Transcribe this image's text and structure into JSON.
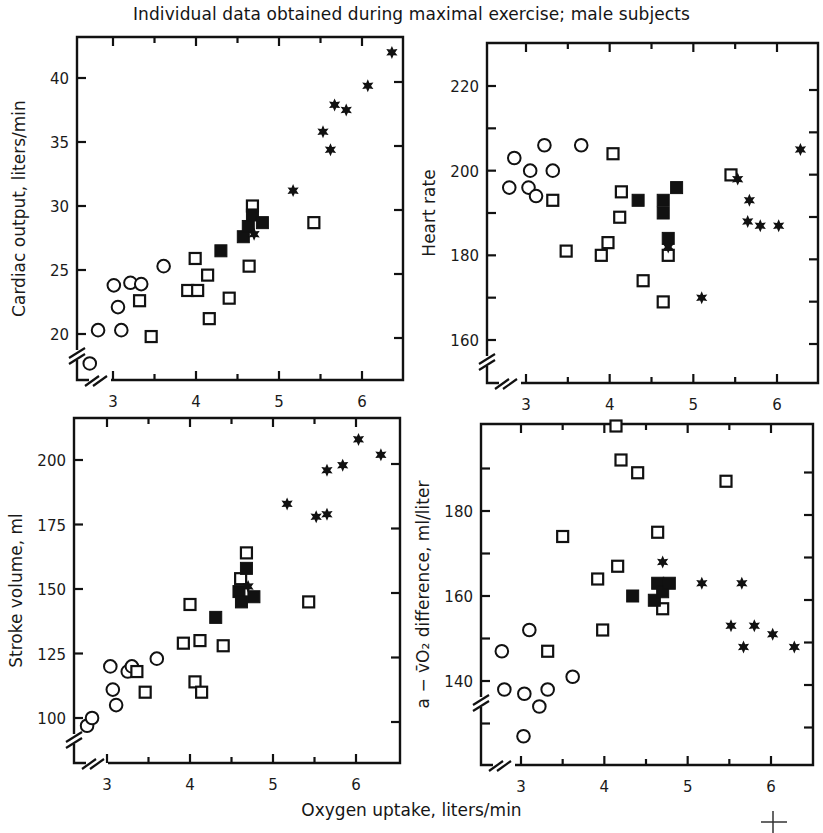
{
  "figure": {
    "title": "Individual data obtained during maximal exercise; male subjects",
    "shared_xlabel": "Oxygen uptake, liters/min"
  },
  "chart_data": [
    {
      "type": "scatter",
      "panel": "top-left",
      "title": "",
      "xlabel": "Oxygen uptake, liters/min",
      "ylabel": "Cardiac output, liters/min",
      "xlim": [
        2.6,
        6.5
      ],
      "ylim": [
        17,
        43
      ],
      "xticks": [
        3,
        4,
        5,
        6
      ],
      "yticks": [
        20,
        25,
        30,
        35,
        40
      ],
      "grid": false,
      "axis_break": true,
      "series": [
        {
          "name": "open circles",
          "marker": "open-circle",
          "points": [
            [
              2.72,
              17.7
            ],
            [
              2.82,
              20.3
            ],
            [
              3.01,
              23.8
            ],
            [
              3.06,
              22.1
            ],
            [
              3.1,
              20.3
            ],
            [
              3.21,
              24.0
            ],
            [
              3.34,
              23.9
            ],
            [
              3.61,
              25.3
            ]
          ]
        },
        {
          "name": "open squares",
          "marker": "open-square",
          "points": [
            [
              3.32,
              22.6
            ],
            [
              3.46,
              19.8
            ],
            [
              3.9,
              23.4
            ],
            [
              3.99,
              25.9
            ],
            [
              4.02,
              23.4
            ],
            [
              4.14,
              24.6
            ],
            [
              4.16,
              21.2
            ],
            [
              4.4,
              22.8
            ],
            [
              4.64,
              25.3
            ],
            [
              4.68,
              30.0
            ],
            [
              5.42,
              28.7
            ]
          ]
        },
        {
          "name": "filled squares",
          "marker": "filled-square",
          "points": [
            [
              4.3,
              26.5
            ],
            [
              4.57,
              27.6
            ],
            [
              4.63,
              28.4
            ],
            [
              4.68,
              29.3
            ],
            [
              4.8,
              28.7
            ]
          ]
        },
        {
          "name": "stars",
          "marker": "star",
          "points": [
            [
              4.7,
              27.8
            ],
            [
              5.17,
              31.2
            ],
            [
              5.53,
              35.8
            ],
            [
              5.62,
              34.4
            ],
            [
              5.67,
              37.9
            ],
            [
              5.81,
              37.5
            ],
            [
              6.07,
              39.4
            ],
            [
              6.36,
              42.0
            ]
          ]
        }
      ]
    },
    {
      "type": "scatter",
      "panel": "top-right",
      "title": "",
      "xlabel": "Oxygen uptake, liters/min",
      "ylabel": "Heart rate",
      "xlim": [
        2.6,
        6.5
      ],
      "ylim": [
        150,
        230
      ],
      "xticks": [
        3,
        4,
        5,
        6
      ],
      "yticks": [
        160,
        180,
        200,
        220
      ],
      "grid": false,
      "axis_break": true,
      "series": [
        {
          "name": "open circles",
          "marker": "open-circle",
          "points": [
            [
              2.8,
              196
            ],
            [
              2.86,
              203
            ],
            [
              3.03,
              196
            ],
            [
              3.05,
              200
            ],
            [
              3.12,
              194
            ],
            [
              3.22,
              206
            ],
            [
              3.32,
              200
            ],
            [
              3.66,
              206
            ]
          ]
        },
        {
          "name": "open squares",
          "marker": "open-square",
          "points": [
            [
              3.32,
              193
            ],
            [
              3.48,
              181
            ],
            [
              3.9,
              180
            ],
            [
              3.98,
              183
            ],
            [
              4.04,
              204
            ],
            [
              4.12,
              189
            ],
            [
              4.14,
              195
            ],
            [
              4.4,
              174
            ],
            [
              4.64,
              169
            ],
            [
              4.7,
              180
            ],
            [
              5.45,
              199
            ]
          ]
        },
        {
          "name": "filled squares",
          "marker": "filled-square",
          "points": [
            [
              4.34,
              193
            ],
            [
              4.64,
              193
            ],
            [
              4.64,
              190
            ],
            [
              4.7,
              184
            ],
            [
              4.8,
              196
            ]
          ]
        },
        {
          "name": "stars",
          "marker": "star",
          "points": [
            [
              4.7,
              182
            ],
            [
              5.1,
              170
            ],
            [
              5.53,
              198
            ],
            [
              5.65,
              188
            ],
            [
              5.67,
              193
            ],
            [
              5.8,
              187
            ],
            [
              6.02,
              187
            ],
            [
              6.28,
              205
            ]
          ]
        }
      ]
    },
    {
      "type": "scatter",
      "panel": "bottom-left",
      "title": "",
      "xlabel": "Oxygen uptake, liters/min",
      "ylabel": "Stroke volume, ml",
      "xlim": [
        2.6,
        6.5
      ],
      "ylim": [
        88,
        215
      ],
      "xticks": [
        3,
        4,
        5,
        6
      ],
      "yticks": [
        100,
        125,
        150,
        175,
        200
      ],
      "grid": false,
      "axis_break": true,
      "series": [
        {
          "name": "open circles",
          "marker": "open-circle",
          "points": [
            [
              2.76,
              97
            ],
            [
              2.82,
              100
            ],
            [
              3.04,
              120
            ],
            [
              3.07,
              111
            ],
            [
              3.11,
              105
            ],
            [
              3.25,
              118
            ],
            [
              3.3,
              120
            ],
            [
              3.6,
              123
            ]
          ]
        },
        {
          "name": "open squares",
          "marker": "open-square",
          "points": [
            [
              3.36,
              118
            ],
            [
              3.46,
              110
            ],
            [
              3.92,
              129
            ],
            [
              4.0,
              144
            ],
            [
              4.06,
              114
            ],
            [
              4.12,
              130
            ],
            [
              4.14,
              110
            ],
            [
              4.4,
              128
            ],
            [
              4.61,
              154
            ],
            [
              4.68,
              164
            ],
            [
              5.43,
              145
            ]
          ]
        },
        {
          "name": "filled squares",
          "marker": "filled-square",
          "points": [
            [
              4.31,
              139
            ],
            [
              4.59,
              149
            ],
            [
              4.62,
              145
            ],
            [
              4.68,
              158
            ],
            [
              4.77,
              147
            ]
          ]
        },
        {
          "name": "stars",
          "marker": "star",
          "points": [
            [
              4.7,
              151
            ],
            [
              5.17,
              183
            ],
            [
              5.52,
              178
            ],
            [
              5.65,
              179
            ],
            [
              5.65,
              196
            ],
            [
              5.84,
              198
            ],
            [
              6.03,
              208
            ],
            [
              6.3,
              202
            ]
          ]
        }
      ]
    },
    {
      "type": "scatter",
      "panel": "bottom-right",
      "title": "",
      "xlabel": "Oxygen uptake, liters/min",
      "ylabel": "a − v̄O2 difference, ml/liter",
      "xlim": [
        2.6,
        6.5
      ],
      "ylim": [
        120,
        200
      ],
      "xticks": [
        3,
        4,
        5,
        6
      ],
      "yticks": [
        140,
        160,
        180
      ],
      "grid": false,
      "axis_break": true,
      "series": [
        {
          "name": "open circles",
          "marker": "open-circle",
          "points": [
            [
              2.77,
              147
            ],
            [
              2.8,
              138
            ],
            [
              3.03,
              127
            ],
            [
              3.04,
              137
            ],
            [
              3.1,
              152
            ],
            [
              3.22,
              134
            ],
            [
              3.32,
              138
            ],
            [
              3.62,
              141
            ]
          ]
        },
        {
          "name": "open squares",
          "marker": "open-square",
          "points": [
            [
              3.32,
              147
            ],
            [
              3.5,
              174
            ],
            [
              3.92,
              164
            ],
            [
              3.98,
              152
            ],
            [
              4.14,
              200
            ],
            [
              4.16,
              167
            ],
            [
              4.2,
              192
            ],
            [
              4.4,
              189
            ],
            [
              4.64,
              175
            ],
            [
              4.7,
              157
            ],
            [
              5.46,
              187
            ]
          ]
        },
        {
          "name": "filled squares",
          "marker": "filled-square",
          "points": [
            [
              4.34,
              160
            ],
            [
              4.6,
              159
            ],
            [
              4.64,
              163
            ],
            [
              4.7,
              161
            ],
            [
              4.78,
              163
            ]
          ]
        },
        {
          "name": "stars",
          "marker": "star",
          "points": [
            [
              4.7,
              168
            ],
            [
              5.17,
              163
            ],
            [
              5.52,
              153
            ],
            [
              5.65,
              163
            ],
            [
              5.67,
              148
            ],
            [
              5.8,
              153
            ],
            [
              6.02,
              151
            ],
            [
              6.28,
              148
            ]
          ]
        }
      ]
    }
  ],
  "panels": [
    {
      "id": "cardiac-output",
      "ylabel": "Cardiac output, liters/min",
      "frame": {
        "left": 77,
        "right": 403,
        "top": 37,
        "bottom": 380
      },
      "xmap": {
        "v0": 3,
        "p0": 113,
        "v1": 6,
        "p1": 362
      },
      "ymap": {
        "v0": 20,
        "p0": 334,
        "v1": 40,
        "p1": 78
      },
      "xticks": [
        3,
        3.5,
        4,
        4.5,
        5,
        5.5,
        6
      ],
      "xtick_labels": [
        3,
        4,
        5,
        6
      ],
      "yticks_left": [
        20,
        25,
        30,
        35,
        40
      ],
      "ytick_labels": [
        20,
        25,
        30,
        35,
        40
      ]
    },
    {
      "id": "heart-rate",
      "ylabel": "Heart rate",
      "frame": {
        "left": 487,
        "right": 818,
        "top": 43,
        "bottom": 383
      },
      "xmap": {
        "v0": 3,
        "p0": 526,
        "v1": 6,
        "p1": 777
      },
      "ymap": {
        "v0": 160,
        "p0": 340,
        "v1": 220,
        "p1": 86
      },
      "xticks": [
        3,
        3.5,
        4,
        4.5,
        5,
        5.5,
        6
      ],
      "xtick_labels": [
        3,
        4,
        5,
        6
      ],
      "yticks_left": [
        160,
        170,
        180,
        190,
        200,
        210,
        220
      ],
      "ytick_labels": [
        160,
        180,
        200,
        220
      ]
    },
    {
      "id": "stroke-volume",
      "ylabel": "Stroke volume, ml",
      "frame": {
        "left": 74,
        "right": 400,
        "top": 418,
        "bottom": 763
      },
      "xmap": {
        "v0": 3,
        "p0": 107,
        "v1": 6,
        "p1": 356
      },
      "ymap": {
        "v0": 100,
        "p0": 718,
        "v1": 200,
        "p1": 460
      },
      "xticks": [
        3,
        3.5,
        4,
        4.5,
        5,
        5.5,
        6
      ],
      "xtick_labels": [
        3,
        4,
        5,
        6
      ],
      "yticks_left": [
        100,
        125,
        150,
        175,
        200
      ],
      "ytick_labels": [
        100,
        125,
        150,
        175,
        200
      ]
    },
    {
      "id": "avo2-difference",
      "ylabel": "a − v̄O₂  difference, ml/liter",
      "frame": {
        "left": 481,
        "right": 813,
        "top": 424,
        "bottom": 765
      },
      "xmap": {
        "v0": 3,
        "p0": 521,
        "v1": 6,
        "p1": 771
      },
      "ymap": {
        "v0": 140,
        "p0": 681,
        "v1": 180,
        "p1": 511
      },
      "xticks": [
        3,
        3.5,
        4,
        4.5,
        5,
        5.5,
        6
      ],
      "xtick_labels": [
        3,
        4,
        5,
        6
      ],
      "yticks_left": [
        130,
        140,
        150,
        160,
        170,
        180,
        190
      ],
      "ytick_labels": [
        140,
        160,
        180
      ]
    }
  ],
  "colors": {
    "ink": "#111111",
    "background": "#ffffff"
  }
}
